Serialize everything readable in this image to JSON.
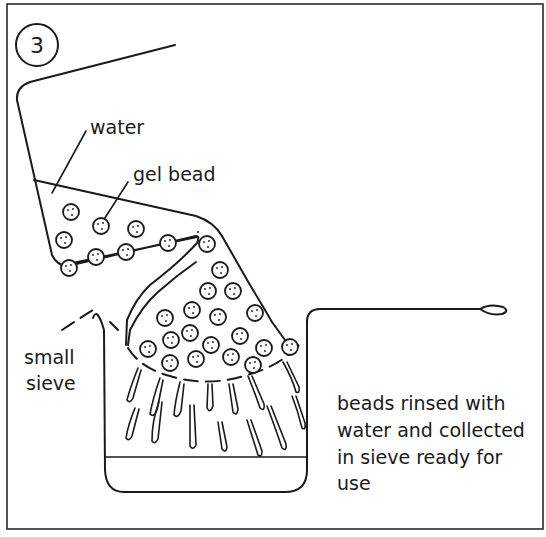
{
  "figure": {
    "step_number": "3",
    "labels": {
      "water": "water",
      "gel_bead": "gel bead",
      "small_sieve_line1": "small",
      "small_sieve_line2": "sieve",
      "caption_line1": "beads rinsed with",
      "caption_line2": "water and collected",
      "caption_line3": "in sieve ready for",
      "caption_line4": "use"
    },
    "colors": {
      "ink": "#1a1a1a",
      "background": "#ffffff"
    }
  }
}
